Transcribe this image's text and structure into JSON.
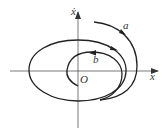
{
  "diagram": {
    "axes": {
      "x_label": "x",
      "y_label": "ẋ",
      "origin_label": "O"
    },
    "curves": [
      {
        "id": "limit-cycle",
        "label": ""
      },
      {
        "id": "trajectory-a",
        "label": "a"
      },
      {
        "id": "trajectory-b",
        "label": "b"
      }
    ],
    "colors": {
      "stroke": "#222222",
      "axis": "#555555",
      "background": "#ffffff"
    }
  }
}
